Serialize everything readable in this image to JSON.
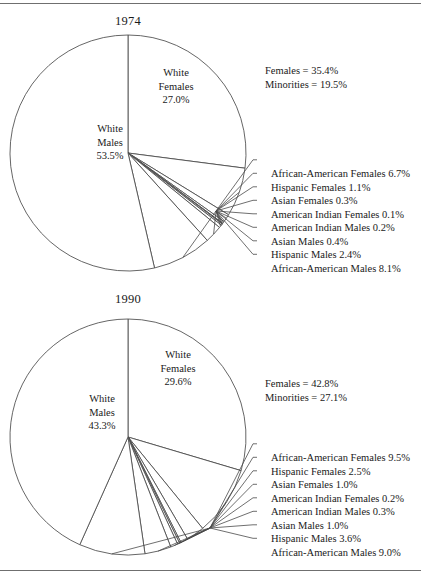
{
  "figure": {
    "rules": [
      "top-rule",
      "bottom-rule"
    ]
  },
  "charts": [
    {
      "id": "chart-1974",
      "title": "1974",
      "summary": {
        "females": "Females = 35.4%",
        "minorities": "Minorities = 19.5%"
      },
      "major_labels": [
        {
          "name": "white-females",
          "l1": "White",
          "l2": "Females",
          "l3": "27.0%"
        },
        {
          "name": "white-males",
          "l1": "White",
          "l2": "Males",
          "l3": "53.5%"
        }
      ],
      "callouts": [
        "African-American Females 6.7%",
        "Hispanic Females 1.1%",
        "Asian Females 0.3%",
        "American Indian Females 0.1%",
        "American Indian Males 0.2%",
        "Asian Males 0.4%",
        "Hispanic Males 2.4%",
        "African-American Males 8.1%"
      ]
    },
    {
      "id": "chart-1990",
      "title": "1990",
      "summary": {
        "females": "Females = 42.8%",
        "minorities": "Minorities = 27.1%"
      },
      "major_labels": [
        {
          "name": "white-females",
          "l1": "White",
          "l2": "Females",
          "l3": "29.6%"
        },
        {
          "name": "white-males",
          "l1": "White",
          "l2": "Males",
          "l3": "43.3%"
        }
      ],
      "callouts": [
        "African-American Females 9.5%",
        "Hispanic Females 2.5%",
        "Asian Females 1.0%",
        "American Indian Females 0.2%",
        "American Indian Males 0.3%",
        "Asian Males 1.0%",
        "Hispanic Males 3.6%",
        "African-American Males 9.0%"
      ]
    }
  ],
  "chart_data": [
    {
      "type": "pie",
      "title": "1974",
      "labels": [
        "White Females",
        "African-American Females",
        "Hispanic Females",
        "Asian Females",
        "American Indian Females",
        "American Indian Males",
        "Asian Males",
        "Hispanic Males",
        "African-American Males",
        "White Males"
      ],
      "values": [
        27.0,
        6.7,
        1.1,
        0.3,
        0.1,
        0.2,
        0.4,
        2.4,
        8.1,
        53.5
      ],
      "start_angle_deg": 0,
      "direction": "clockwise",
      "annotations": [
        "Females = 35.4%",
        "Minorities = 19.5%"
      ],
      "legend": "callout-lines-right",
      "grid": false
    },
    {
      "type": "pie",
      "title": "1990",
      "labels": [
        "White Females",
        "African-American Females",
        "Hispanic Females",
        "Asian Females",
        "American Indian Females",
        "American Indian Males",
        "Asian Males",
        "Hispanic Males",
        "African-American Males",
        "White Males"
      ],
      "values": [
        29.6,
        9.5,
        2.5,
        1.0,
        0.2,
        0.3,
        1.0,
        3.6,
        9.0,
        43.3
      ],
      "start_angle_deg": 0,
      "direction": "clockwise",
      "annotations": [
        "Females = 42.8%",
        "Minorities = 27.1%"
      ],
      "legend": "callout-lines-right",
      "grid": false
    }
  ],
  "colors": {
    "stroke": "#4a4a4a",
    "rule": "#6f6f6f",
    "text": "#1a1a1a",
    "slice_fill": "#ffffff"
  }
}
